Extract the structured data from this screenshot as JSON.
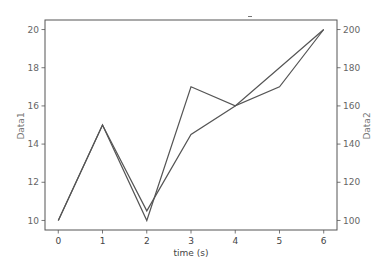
{
  "chart_data": {
    "type": "line",
    "title": "",
    "xlabel": "time (s)",
    "ylabel": "Data1",
    "ylabel_right": "Data2",
    "x": [
      0,
      1,
      2,
      3,
      4,
      5,
      6
    ],
    "xlim": [
      -0.3,
      6.3
    ],
    "ylim": [
      9.5,
      20.5
    ],
    "ylim_right": [
      95,
      205
    ],
    "xticks": [
      "0",
      "1",
      "2",
      "3",
      "4",
      "5",
      "6"
    ],
    "yticks": [
      "10",
      "12",
      "14",
      "16",
      "18",
      "20"
    ],
    "yticks_right": [
      "100",
      "120",
      "140",
      "160",
      "180",
      "200"
    ],
    "grid": false,
    "legend": null,
    "series": [
      {
        "name": "Data1",
        "axis": "left",
        "values": [
          10,
          15,
          10,
          17,
          16,
          17,
          20
        ],
        "color": "#555555"
      },
      {
        "name": "Data2",
        "axis": "right",
        "values": [
          100,
          150,
          105,
          145,
          160,
          180,
          200
        ],
        "color": "#555555"
      }
    ]
  },
  "colors": {
    "line": "#555555",
    "frame": "#555555",
    "tick_text": "#666666"
  }
}
